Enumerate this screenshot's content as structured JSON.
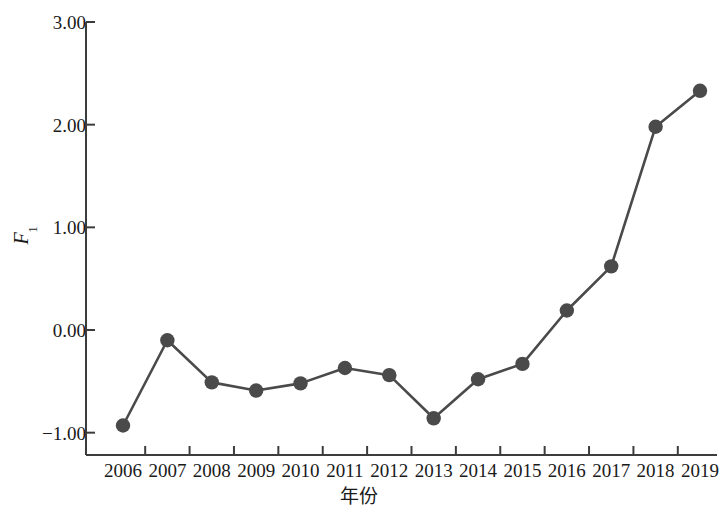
{
  "chart_data": {
    "type": "line",
    "title": "",
    "xlabel": "年份",
    "ylabel": "F1",
    "ylabel_base": "F",
    "ylabel_sub": "1",
    "categories": [
      "2006",
      "2007",
      "2008",
      "2009",
      "2010",
      "2011",
      "2012",
      "2013",
      "2014",
      "2015",
      "2016",
      "2017",
      "2018",
      "2019"
    ],
    "values": [
      -0.93,
      -0.1,
      -0.51,
      -0.59,
      -0.52,
      -0.37,
      -0.44,
      -0.86,
      -0.48,
      -0.33,
      0.19,
      0.62,
      1.98,
      2.33
    ],
    "series": [
      {
        "name": "F1",
        "values": [
          -0.93,
          -0.1,
          -0.51,
          -0.59,
          -0.52,
          -0.37,
          -0.44,
          -0.86,
          -0.48,
          -0.33,
          0.19,
          0.62,
          1.98,
          2.33
        ]
      }
    ],
    "ylim": [
      -1.5,
      3.0
    ],
    "xlim": [
      2005.5,
      2019.5
    ],
    "yticks": [
      3.0,
      2.0,
      1.0,
      0.0,
      -1.0
    ],
    "ytick_labels": [
      "3.00",
      "2.00",
      "1.00",
      "0.00",
      "-1.00"
    ],
    "grid": false,
    "legend": null,
    "marker": "circle",
    "line_color": "#4a4a4a",
    "marker_color": "#4a4a4a",
    "axis_color": "#3c3c3c"
  },
  "axes": {
    "y_label_base": "F",
    "y_label_sub": "1",
    "x_title": "年份"
  }
}
